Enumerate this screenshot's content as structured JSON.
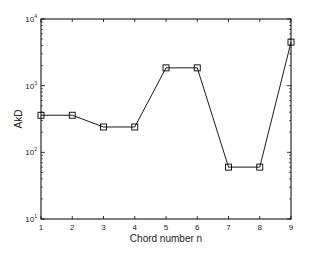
{
  "chart_data": {
    "type": "line",
    "title": "",
    "xlabel": "Chord number n",
    "ylabel": "AkD",
    "yscale": "log",
    "xlim": [
      1,
      9
    ],
    "ylim": [
      10,
      10000
    ],
    "x": [
      1,
      2,
      3,
      4,
      5,
      6,
      7,
      8,
      9
    ],
    "series": [
      {
        "name": "AkD",
        "marker": "square",
        "color": "#000000",
        "values": [
          360,
          360,
          240,
          240,
          1850,
          1850,
          60,
          60,
          4500
        ]
      }
    ],
    "xticks": [
      "1",
      "2",
      "3",
      "4",
      "5",
      "6",
      "7",
      "8",
      "9"
    ],
    "yticks": [
      {
        "base": "10",
        "exp": "1",
        "value": 10
      },
      {
        "base": "10",
        "exp": "2",
        "value": 100
      },
      {
        "base": "10",
        "exp": "3",
        "value": 1000
      },
      {
        "base": "10",
        "exp": "4",
        "value": 10000
      }
    ],
    "grid": false,
    "legend": "none"
  }
}
